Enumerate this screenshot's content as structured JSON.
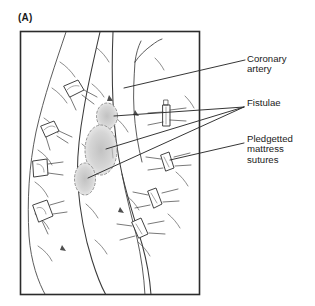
{
  "figure": {
    "panel_label": "(A)",
    "frame": {
      "x": 20,
      "y": 31,
      "width": 180,
      "height": 264
    },
    "line_color": "#3a3a3a",
    "frame_color": "#2b2b2b",
    "fistula_fill": "#d8d8d8",
    "background": "#ffffff"
  },
  "callouts": [
    {
      "id": "coronary-artery",
      "text": "Coronary\nartery",
      "leader_from": [
        245,
        60
      ],
      "leader_to": [
        124,
        88
      ]
    },
    {
      "id": "fistulae",
      "text": "Fistulae",
      "leader_from": [
        244,
        107
      ],
      "leader_to": [
        105,
        117
      ]
    },
    {
      "id": "pledgetted-mattress-sutures",
      "text": "Pledgetted\nmattress\nsutures",
      "leader_from": [
        244,
        143
      ],
      "leader_to": [
        168,
        161
      ]
    }
  ],
  "annotated_structures": {
    "coronary_artery_label": "Coronary artery",
    "fistulae_label": "Fistulae",
    "pledget_label": "Pledgetted mattress sutures",
    "fistulae_count": 3,
    "pledget_suture_count": 8
  }
}
